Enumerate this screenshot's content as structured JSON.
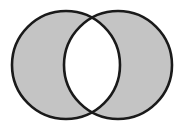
{
  "diagram": {
    "type": "venn",
    "operation": "symmetric-difference",
    "sets": [
      {
        "name": "A",
        "cx": 66,
        "cy": 65,
        "r": 54
      },
      {
        "name": "B",
        "cx": 118,
        "cy": 65,
        "r": 54
      }
    ],
    "shaded_regions": [
      "A-only",
      "B-only"
    ],
    "unshaded_regions": [
      "A-intersect-B"
    ],
    "colors": {
      "background": "#ffffff",
      "fill": "#c4c4c4",
      "intersection": "#ffffff",
      "stroke": "#1a1a1a"
    },
    "stroke_width": 2.6
  }
}
